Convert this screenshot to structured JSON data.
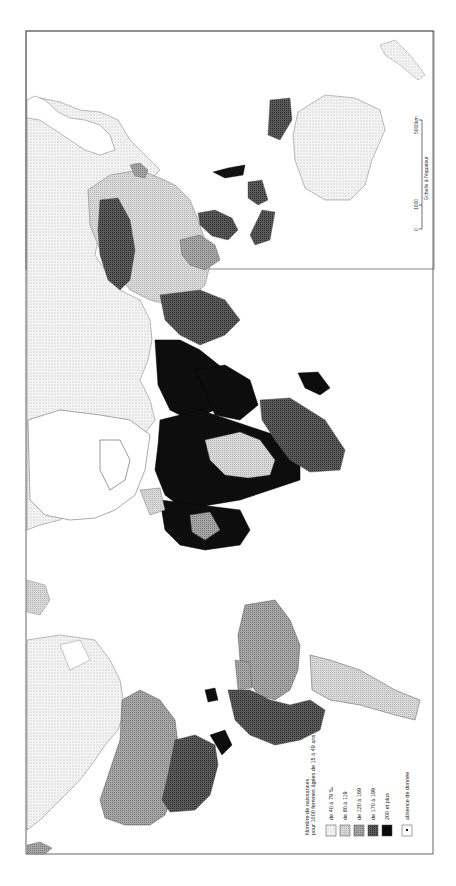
{
  "map": {
    "orientation": "rotated-90-ccw",
    "subject": "Taux de fécondité générale",
    "legend": {
      "title_line1": "Nombre de naissances",
      "title_line2": "pour 1000 femmes âgées de 15 à 49 ans",
      "classes": [
        {
          "label": "de 40 à 79 ‰",
          "pattern": "light-dots",
          "color": "#efefef"
        },
        {
          "label": "de 80 à 119",
          "pattern": "light-gray",
          "color": "#cfcfcf"
        },
        {
          "label": "de 120 à 169",
          "pattern": "medium-gray",
          "color": "#9a9a9a"
        },
        {
          "label": "de 170 à 199",
          "pattern": "dark-gray",
          "color": "#4a4a4a"
        },
        {
          "label": "200 et plus",
          "pattern": "black",
          "color": "#0a0a0a"
        },
        {
          "label": "absence de donnée",
          "pattern": "white-with-dot",
          "color": "#ffffff"
        }
      ]
    },
    "scale": {
      "label": "Echelle à l'équateur",
      "ticks": [
        "0",
        "1000",
        "5000km"
      ]
    }
  }
}
